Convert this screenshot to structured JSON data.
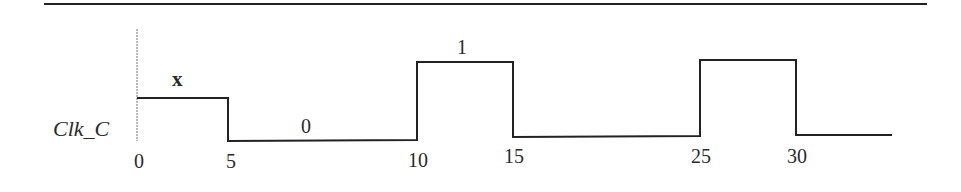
{
  "diagram": {
    "type": "timing-diagram",
    "signal": {
      "name": "Clk_C",
      "segments": [
        {
          "from": 0,
          "to": 5,
          "value": "x"
        },
        {
          "from": 5,
          "to": 10,
          "value": "0"
        },
        {
          "from": 10,
          "to": 15,
          "value": "1"
        },
        {
          "from": 15,
          "to": 25,
          "value": "0"
        },
        {
          "from": 25,
          "to": 30,
          "value": "1"
        },
        {
          "from": 30,
          "to": null,
          "value": "0"
        }
      ],
      "annotations": [
        {
          "text": "x",
          "segment": 0
        },
        {
          "text": "0",
          "segment": 1
        },
        {
          "text": "1",
          "segment": 2
        }
      ]
    },
    "time_ticks": [
      "0",
      "5",
      "10",
      "15",
      "25",
      "30"
    ],
    "colors": {
      "line": "#222222",
      "background": "#ffffff",
      "axis": "#777777"
    }
  }
}
